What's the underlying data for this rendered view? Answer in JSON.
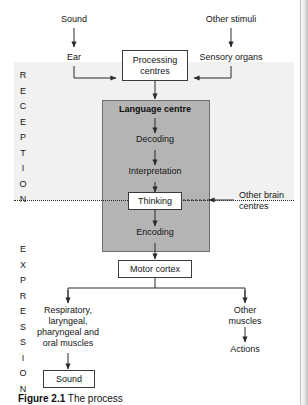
{
  "figure": {
    "caption_label": "Figure 2.1",
    "caption_rest": "  The process",
    "sections": {
      "reception": "RECEPTION",
      "expression": "EXPRESSION"
    }
  },
  "nodes": {
    "sound_in": "Sound",
    "ear": "Ear",
    "other_stimuli": "Other stimuli",
    "sensory_organs": "Sensory organs",
    "processing_centres": "Processing\ncentres",
    "language_centre": "Language centre",
    "decoding": "Decoding",
    "interpretation": "Interpretation",
    "thinking": "Thinking",
    "other_brain_centres": "Other brain\ncentres",
    "encoding": "Encoding",
    "motor_cortex": "Motor cortex",
    "speech_muscles": "Respiratory,\nlaryngeal,\npharyngeal and\noral muscles",
    "other_muscles": "Other\nmuscles",
    "actions": "Actions",
    "sound_out": "Sound"
  },
  "colors": {
    "language_block_fill": "#b4b4b4",
    "reception_band_fill": "#f1f1f1",
    "box_border": "#3a3a3a",
    "wire": "#2b2b2b",
    "text": "#141414"
  }
}
